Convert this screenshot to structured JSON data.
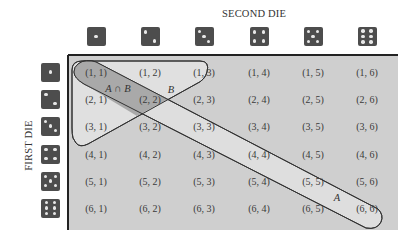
{
  "figure": {
    "column_axis_title": "SECOND DIE",
    "row_axis_title": "FIRST DIE",
    "die_faces": [
      1,
      2,
      3,
      4,
      5,
      6
    ],
    "colors": {
      "die_body": "#4d4d4d",
      "die_pip": "#e8e8e8",
      "grid_background": "#cfcfcf",
      "event_A_fill": "#e0e0e0",
      "event_B_fill": "#e0e0e0",
      "intersection_fill": "#a9a9a9",
      "outline": "#333333"
    },
    "grid": {
      "rows": [
        [
          "(1, 1)",
          "(1, 2)",
          "(1, 3)",
          "(1, 4)",
          "(1, 5)",
          "(1, 6)"
        ],
        [
          "(2, 1)",
          "(2, 2)",
          "(2, 3)",
          "(2, 4)",
          "(2, 5)",
          "(2, 6)"
        ],
        [
          "(3, 1)",
          "(3, 2)",
          "(3, 3)",
          "(3, 4)",
          "(3, 5)",
          "(3, 6)"
        ],
        [
          "(4, 1)",
          "(4, 2)",
          "(4, 3)",
          "(4, 4)",
          "(4, 5)",
          "(4, 6)"
        ],
        [
          "(5, 1)",
          "(5, 2)",
          "(5, 3)",
          "(5, 4)",
          "(5, 5)",
          "(5, 6)"
        ],
        [
          "(6, 1)",
          "(6, 2)",
          "(6, 3)",
          "(6, 4)",
          "(6, 5)",
          "(6, 6)"
        ]
      ]
    },
    "events": {
      "A": {
        "label": "A",
        "description_outcomes": [
          "(1, 1)",
          "(2, 2)",
          "(3, 3)",
          "(4, 4)",
          "(5, 5)",
          "(6, 6)"
        ]
      },
      "B": {
        "label": "B",
        "description_outcomes": [
          "(1, 1)",
          "(1, 2)",
          "(1, 3)",
          "(2, 1)",
          "(2, 2)",
          "(3, 1)"
        ]
      },
      "A_intersect_B": {
        "label": "A ∩ B",
        "description_outcomes": [
          "(1, 1)",
          "(2, 2)"
        ]
      }
    }
  }
}
